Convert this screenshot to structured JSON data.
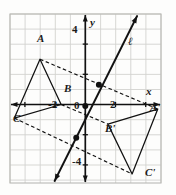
{
  "figure": {
    "kind": "coordinate-plane-reflection-diagram",
    "grid": {
      "x_min_px": 10,
      "y_min_px": 14,
      "x_max_px": 161,
      "y_max_px": 183,
      "cell_px": 15.1,
      "origin_px": {
        "x": 85.3,
        "y": 104.5
      },
      "grid_color": "#d3d3cf",
      "border_color": "#b9b9b4",
      "show_grid": true
    },
    "axes": {
      "x_label": "x",
      "y_label": "y",
      "axis_color": "#111111",
      "x_ticks": [
        {
          "label": "-2",
          "value": -2
        },
        {
          "label": "2",
          "value": 2
        }
      ],
      "y_ticks": [
        {
          "label": "4",
          "value": 4
        },
        {
          "label": "-4",
          "value": -4
        }
      ],
      "origin_label": "0"
    },
    "line_of_reflection": {
      "name": "l",
      "label": "ℓ",
      "color": "#111111",
      "style": "solid",
      "arrow_both_ends": true,
      "point_1": {
        "x": -1.0,
        "y": -3.0
      },
      "point_2": {
        "x": 2.0,
        "y": 3.0
      }
    },
    "preimage": {
      "name": "ABC",
      "color": "#111111",
      "style": "solid",
      "vertices": [
        {
          "label": "A",
          "x": -3.0,
          "y": 3.0
        },
        {
          "label": "B",
          "x": -1.6,
          "y": 0.0
        },
        {
          "label": "C",
          "x": -4.7,
          "y": -0.9
        }
      ]
    },
    "image": {
      "name": "A'B'C'",
      "color": "#111111",
      "style": "solid",
      "vertices": [
        {
          "label": "A'",
          "x": 4.8,
          "y": -0.3
        },
        {
          "label": "B'",
          "x": 1.5,
          "y": -1.3
        },
        {
          "label": "C'",
          "x": 3.1,
          "y": -4.6
        }
      ]
    },
    "connectors": {
      "style": "dashed",
      "color": "#111111",
      "pairs": [
        {
          "from": "A",
          "to": "A'"
        },
        {
          "from": "B",
          "to": "B'"
        },
        {
          "from": "C",
          "to": "C'"
        }
      ]
    },
    "midpoint_dots": [
      {
        "x": 0.9,
        "y": 1.3
      },
      {
        "x": 0.0,
        "y": -0.1
      },
      {
        "x": -0.6,
        "y": -2.2
      }
    ],
    "dot_color": "#111111",
    "dot_radius_px": 3.0
  }
}
